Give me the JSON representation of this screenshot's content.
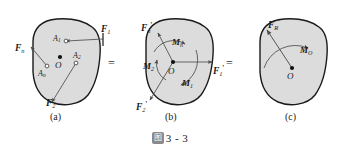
{
  "figure": {
    "caption_badge": "图",
    "caption_text": "3 - 3",
    "background_color": "#ffffff",
    "body_fill_color": "#dcdcdc",
    "body_stroke_color": "#1a1a1a",
    "arrow_color": "#555555",
    "equals_sign": "="
  },
  "panels": [
    {
      "id": "a",
      "label": "(a)",
      "origin_label": "O",
      "points": [
        {
          "name": "point-a1",
          "label": "A",
          "sub": "1"
        },
        {
          "name": "point-a2",
          "label": "A",
          "sub": "2"
        },
        {
          "name": "point-an",
          "label": "A",
          "sub": "n"
        }
      ],
      "forces": [
        {
          "name": "force-f1",
          "label": "F",
          "sub": "1",
          "prime": ""
        },
        {
          "name": "force-f2",
          "label": "F",
          "sub": "2",
          "prime": ""
        },
        {
          "name": "force-fn",
          "label": "F",
          "sub": "n",
          "prime": ""
        }
      ],
      "moments": []
    },
    {
      "id": "b",
      "label": "(b)",
      "origin_label": "O",
      "points": [],
      "forces": [
        {
          "name": "force-f1-prime",
          "label": "F",
          "sub": "1",
          "prime": "'"
        },
        {
          "name": "force-f2-prime",
          "label": "F",
          "sub": "2",
          "prime": "'"
        },
        {
          "name": "force-fn-prime",
          "label": "F",
          "sub": "n",
          "prime": "'"
        }
      ],
      "moments": [
        {
          "name": "moment-m1",
          "label": "M",
          "sub": "1"
        },
        {
          "name": "moment-m2",
          "label": "M",
          "sub": "2"
        },
        {
          "name": "moment-mn",
          "label": "M",
          "sub": "n"
        }
      ]
    },
    {
      "id": "c",
      "label": "(c)",
      "origin_label": "O",
      "points": [],
      "forces": [
        {
          "name": "force-fr-prime",
          "label": "F",
          "sub": "R",
          "prime": "'"
        }
      ],
      "moments": [
        {
          "name": "moment-mo",
          "label": "M",
          "sub": "O"
        }
      ]
    }
  ]
}
